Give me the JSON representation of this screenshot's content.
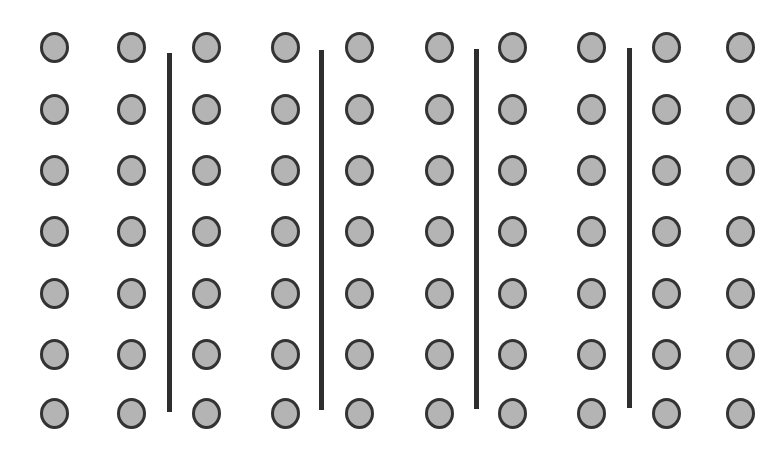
{
  "diagram": {
    "rows": 7,
    "columns": 10,
    "group_size_columns": 2,
    "groups": 5,
    "total_circles": 70,
    "dividers": 4,
    "colors": {
      "circle_fill": "#b4b4b4",
      "circle_stroke": "#333333",
      "divider": "#2e2e2e",
      "background": "#ffffff"
    },
    "column_x": [
      55,
      132,
      207,
      286,
      360,
      440,
      513,
      592,
      667,
      741
    ],
    "row_y": [
      47,
      109,
      170,
      231,
      293,
      354,
      413
    ],
    "divider_lines": [
      {
        "x": 169,
        "y1": 53,
        "y2": 412
      },
      {
        "x": 321,
        "y1": 50,
        "y2": 410
      },
      {
        "x": 476,
        "y1": 49,
        "y2": 409
      },
      {
        "x": 629,
        "y1": 48,
        "y2": 408
      }
    ]
  }
}
